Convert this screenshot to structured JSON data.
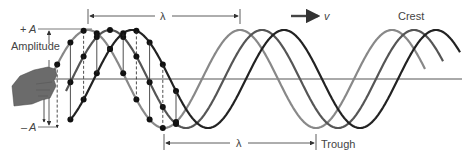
{
  "labels": {
    "plus_a_sign": "+",
    "plus_a": "A",
    "minus_a_sign": "–",
    "minus_a": "A",
    "amplitude": "Amplitude",
    "lambda_top": "λ",
    "lambda_bottom": "λ",
    "velocity": "v",
    "crest": "Crest",
    "trough": "Trough"
  },
  "waves": [
    {
      "name": "wave-light",
      "color": "#888888",
      "phase_x": 88
    },
    {
      "name": "wave-medium",
      "color": "#555555",
      "phase_x": 110
    },
    {
      "name": "wave-dark",
      "color": "#222222",
      "phase_x": 132
    }
  ],
  "geometry": {
    "baseline_y": 79,
    "crest_y": 30,
    "trough_y": 128,
    "wavelength_px": 152
  },
  "colors": {
    "hand": "#6b6b6b",
    "axis": "#555555",
    "dots": "#111111"
  }
}
